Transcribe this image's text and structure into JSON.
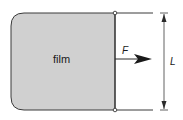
{
  "diagram": {
    "film_label": "film",
    "force_label": "F",
    "length_label": "L",
    "colors": {
      "film_fill": "#d0d0d0",
      "stroke": "#3a3a3a",
      "background": "#ffffff"
    }
  }
}
